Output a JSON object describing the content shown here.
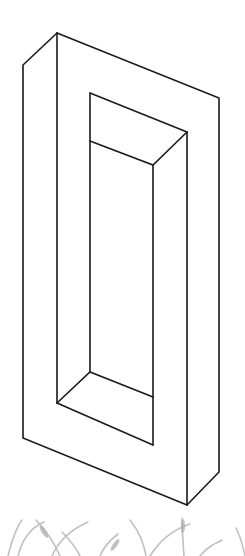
{
  "figure": {
    "stroke_color": "#1a1a1a",
    "grass_color": "#9a9a9a",
    "background": "#ffffff"
  }
}
